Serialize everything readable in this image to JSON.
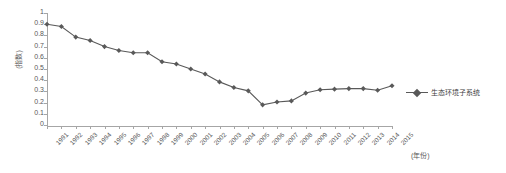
{
  "chart_data": {
    "type": "line",
    "title": "",
    "xlabel": "(年份)",
    "ylabel": "(指数)",
    "ylim": [
      0,
      1
    ],
    "yticks": [
      "0",
      "0.1",
      "0.2",
      "0.3",
      "0.4",
      "0.5",
      "0.6",
      "0.7",
      "0.8",
      "0.9",
      "1"
    ],
    "grid": false,
    "legend_position": "right",
    "categories": [
      "1991",
      "1992",
      "1993",
      "1994",
      "1995",
      "1996",
      "1997",
      "1998",
      "1999",
      "2000",
      "2001",
      "2002",
      "2003",
      "2004",
      "2005",
      "2006",
      "2007",
      "2008",
      "2009",
      "2010",
      "2011",
      "2012",
      "2013",
      "2014",
      "2015"
    ],
    "series": [
      {
        "name": "生态环境子系统",
        "color": "#595959",
        "marker": "diamond",
        "values": [
          0.9,
          0.88,
          0.785,
          0.755,
          0.7,
          0.665,
          0.645,
          0.645,
          0.565,
          0.545,
          0.5,
          0.455,
          0.385,
          0.335,
          0.305,
          0.18,
          0.205,
          0.215,
          0.285,
          0.315,
          0.32,
          0.325,
          0.325,
          0.31,
          0.35
        ]
      }
    ]
  },
  "legend": {
    "entries": [
      {
        "label": "生态环境子系统"
      }
    ]
  }
}
